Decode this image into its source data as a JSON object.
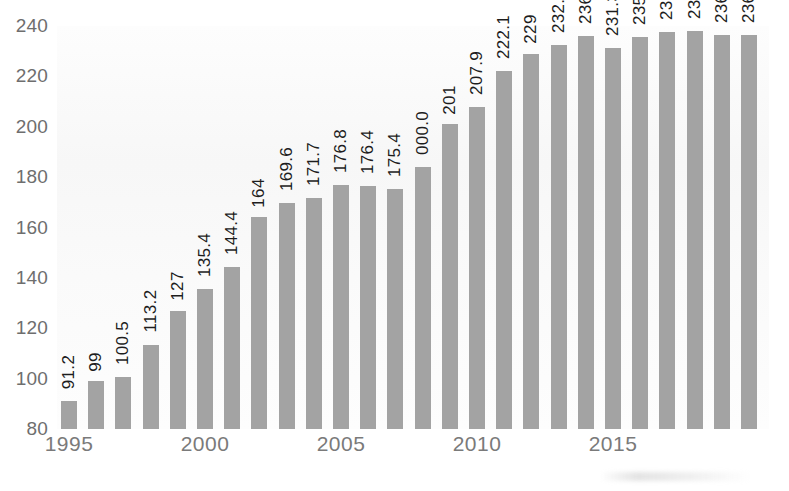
{
  "chart_data": {
    "type": "bar",
    "title": "",
    "subtitle": "",
    "xlabel": "",
    "ylabel": "",
    "ylim": [
      80,
      240
    ],
    "grid": false,
    "legend": null,
    "y_ticks": [
      "240",
      "220",
      "200",
      "180",
      "160",
      "140",
      "120",
      "100",
      "80"
    ],
    "y_tick_values": [
      240,
      220,
      200,
      180,
      160,
      140,
      120,
      100,
      80
    ],
    "x_ticks": [
      "1995",
      "2000",
      "2005",
      "2010",
      "2015"
    ],
    "x_tick_values": [
      1995,
      2000,
      2005,
      2010,
      2015
    ],
    "categories": [
      "1995",
      "1996",
      "1997",
      "1998",
      "1999",
      "1900",
      "1901",
      "1902",
      "1903",
      "1904",
      "1905",
      "1906",
      "1907",
      "1908",
      "1909",
      "1910",
      "1911",
      "1912",
      "1913",
      "1914",
      "1915",
      "1916",
      "1917",
      "1918",
      "1919",
      "1920"
    ],
    "values": [
      91.2,
      99,
      100.5,
      113.2,
      127,
      135.4,
      144.4,
      164,
      169.6,
      171.7,
      176.8,
      176.4,
      175.4,
      184,
      201,
      207.9,
      222.1,
      229,
      232.5,
      236.1,
      231.3,
      235.6,
      237.6,
      238.2,
      236.6,
      236.6
    ],
    "data_labels": [
      "91.2",
      "99",
      "100.5",
      "113.2",
      "127",
      "135.4",
      "144.4",
      "164",
      "169.6",
      "171.7",
      "176.8",
      "176.4",
      "175.4",
      "000.0",
      "201",
      "207.9",
      "222.1",
      "229",
      "232.5",
      "236.1",
      "231.3",
      "235.6",
      "237.6",
      "238.2",
      "236.6",
      "236.6"
    ],
    "bar_color": "#a3a3a3",
    "label_color": "#1d1d1d",
    "axis_color": "#7a7a7a",
    "plot_background": "#fbfbfb"
  }
}
